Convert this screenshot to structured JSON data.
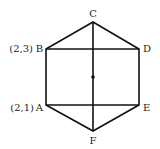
{
  "diagram": {
    "type": "hexagon",
    "vertices": {
      "A": {
        "label": "A",
        "coord_label": "(2,1)"
      },
      "B": {
        "label": "B",
        "coord_label": "(2,3)"
      },
      "C": {
        "label": "C"
      },
      "D": {
        "label": "D"
      },
      "E": {
        "label": "E"
      },
      "F": {
        "label": "F"
      }
    },
    "segments": [
      "AB",
      "BC",
      "CD",
      "DE",
      "EF",
      "FA",
      "BD",
      "AE",
      "CF"
    ],
    "center_point": true,
    "stroke_color": "#111111"
  }
}
